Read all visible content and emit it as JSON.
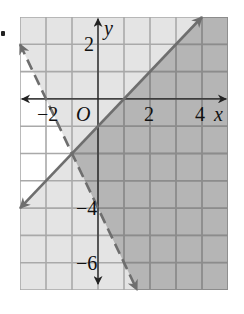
{
  "chart_data": {
    "type": "inequality-graph",
    "title": "",
    "xlabel": "x",
    "ylabel": "y",
    "origin_label": "O",
    "xlim": [
      -3,
      5
    ],
    "ylim": [
      -7,
      3
    ],
    "grid": true,
    "x_tick_labels": [
      {
        "value": -2,
        "label": "−2"
      },
      {
        "value": 2,
        "label": "2"
      },
      {
        "value": 4,
        "label": "4"
      }
    ],
    "y_tick_labels": [
      {
        "value": 2,
        "label": "2"
      },
      {
        "value": -4,
        "label": "−4"
      },
      {
        "value": -6,
        "label": "−6"
      }
    ],
    "boundaries": [
      {
        "name": "solid-line",
        "equation": "y = x - 1",
        "slope": 1,
        "intercept": -1,
        "style": "solid",
        "from": [
          -3,
          -4
        ],
        "to": [
          4,
          3
        ]
      },
      {
        "name": "dashed-line",
        "equation": "y = -2x - 4",
        "slope": -2,
        "intercept": -4,
        "style": "dashed",
        "from": [
          -3,
          2
        ],
        "to": [
          1.5,
          -7
        ]
      }
    ],
    "regions": [
      {
        "name": "solution-region",
        "description": "y < x - 1 and y > -2x - 4",
        "shade": "dark"
      },
      {
        "name": "single-inequality-region",
        "description": "exactly one inequality satisfied",
        "shade": "light"
      },
      {
        "name": "unshaded-region",
        "description": "y > x - 1 and y < -2x - 4",
        "shade": "white"
      }
    ]
  },
  "colors": {
    "dark_fill": "#b5b5b5",
    "light_fill": "#e4e4e4",
    "white_fill": "#ffffff",
    "grid_dark": "#8c8c8c",
    "grid_light": "#a9a9a9",
    "line": "#6e6e6e",
    "axis": "#222222"
  }
}
